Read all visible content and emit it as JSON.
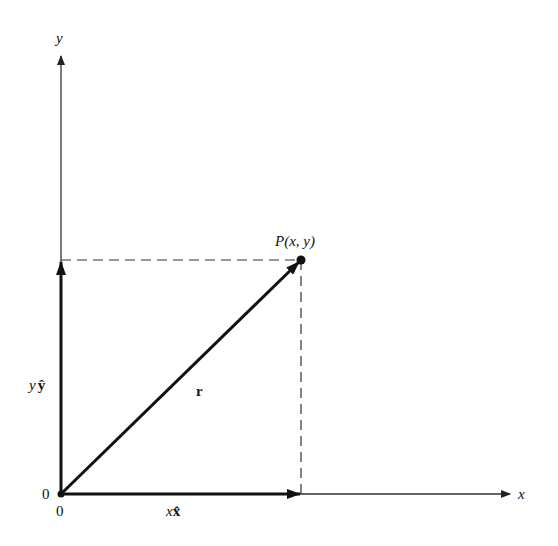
{
  "diagram": {
    "type": "vector-decomposition",
    "axes": {
      "x_label": "x",
      "y_label": "y",
      "origin_label_left": "0",
      "origin_label_below": "0"
    },
    "point": {
      "label": "P(x, y)"
    },
    "vectors": {
      "r": {
        "label": "r"
      },
      "x_component": {
        "label_var": "x",
        "label_unit": "x̂"
      },
      "y_component": {
        "label_var": "y",
        "label_unit": "ŷ"
      }
    },
    "colors": {
      "ink": "#111111",
      "axis": "#333333",
      "background": "#ffffff"
    }
  }
}
